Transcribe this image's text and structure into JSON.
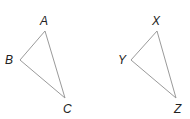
{
  "figure": {
    "stroke_color": "#9a9a9a",
    "label_color": "#222222",
    "triangles": [
      {
        "name": "triangle-abc",
        "vertices": [
          {
            "label": "A",
            "x": 45,
            "y": 31,
            "lx": 44,
            "ly": 25
          },
          {
            "label": "B",
            "x": 20,
            "y": 60,
            "lx": 9,
            "ly": 64
          },
          {
            "label": "C",
            "x": 65,
            "y": 98,
            "lx": 63,
            "ly": 113
          }
        ]
      },
      {
        "name": "triangle-xyz",
        "vertices": [
          {
            "label": "X",
            "x": 157,
            "y": 31,
            "lx": 152,
            "ly": 25
          },
          {
            "label": "Y",
            "x": 131,
            "y": 60,
            "lx": 118,
            "ly": 64
          },
          {
            "label": "Z",
            "x": 176,
            "y": 98,
            "lx": 175,
            "ly": 113
          }
        ]
      }
    ]
  }
}
